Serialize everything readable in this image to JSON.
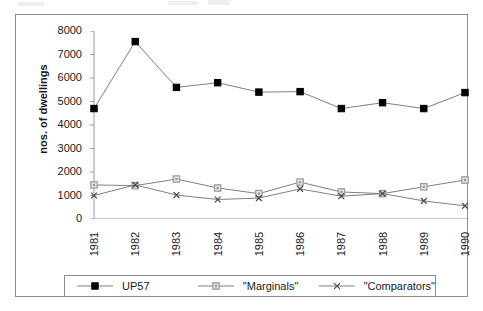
{
  "chart_data": {
    "type": "line",
    "title": "",
    "subtitle": "",
    "xlabel": "",
    "ylabel": "nos. of dwellings",
    "categories": [
      "1981",
      "1982",
      "1983",
      "1984",
      "1985",
      "1986",
      "1987",
      "1988",
      "1989",
      "1990"
    ],
    "ylim": [
      0,
      8000
    ],
    "ytick_step": 1000,
    "yticks": [
      "8000",
      "7000",
      "6000",
      "5000",
      "4000",
      "3000",
      "2000",
      "1000",
      "0"
    ],
    "grid": false,
    "legend_position": "bottom",
    "series": [
      {
        "name": "UP57",
        "marker": "filled-square",
        "color": "#000000",
        "line_color": "#808080",
        "values": [
          4700,
          7550,
          5600,
          5800,
          5400,
          5420,
          4700,
          4950,
          4700,
          5380
        ]
      },
      {
        "name": "\"Marginals\"",
        "marker": "open-square",
        "color": "#9a9a9a",
        "line_color": "#808080",
        "values": [
          1450,
          1420,
          1700,
          1320,
          1080,
          1570,
          1150,
          1080,
          1370,
          1660
        ]
      },
      {
        "name": "\"Comparators\"",
        "marker": "x",
        "color": "#4d4d4d",
        "line_color": "#808080",
        "values": [
          1000,
          1450,
          1020,
          830,
          890,
          1280,
          970,
          1080,
          770,
          560
        ]
      }
    ]
  },
  "legend": {
    "entries": [
      {
        "label": "UP57"
      },
      {
        "label": "\"Marginals\""
      },
      {
        "label": "\"Comparators\""
      }
    ]
  }
}
